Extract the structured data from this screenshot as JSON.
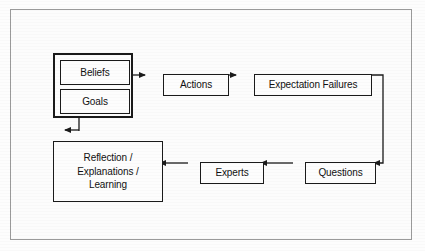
{
  "diagram": {
    "background_color": "#fcfcfc",
    "line_color": "#1a1a1a",
    "frame_color": "#9a9a9a",
    "nodes": [
      {
        "id": "mental-state",
        "label": ""
      },
      {
        "id": "beliefs",
        "label": "Beliefs"
      },
      {
        "id": "goals",
        "label": "Goals"
      },
      {
        "id": "actions",
        "label": "Actions"
      },
      {
        "id": "expectation-failures",
        "label": "Expectation Failures"
      },
      {
        "id": "reflection",
        "label": "Reflection /\nExplanations /\nLearning"
      },
      {
        "id": "experts",
        "label": "Experts"
      },
      {
        "id": "questions",
        "label": "Questions"
      }
    ],
    "edges": [
      {
        "id": "edge-beliefsgoals-to-actions",
        "from": "mental-state",
        "to": "actions",
        "direction": "right"
      },
      {
        "id": "edge-actions-to-expectation-failures",
        "from": "actions",
        "to": "expectation-failures",
        "direction": "right"
      },
      {
        "id": "edge-expectation-failures-to-questions",
        "from": "expectation-failures",
        "to": "questions",
        "direction": "down-left"
      },
      {
        "id": "edge-questions-to-experts",
        "from": "questions",
        "to": "experts",
        "direction": "left"
      },
      {
        "id": "edge-experts-to-reflection",
        "from": "experts",
        "to": "reflection",
        "direction": "left"
      },
      {
        "id": "edge-reflection-to-mental-state",
        "from": "reflection",
        "to": "mental-state",
        "direction": "up"
      }
    ]
  }
}
